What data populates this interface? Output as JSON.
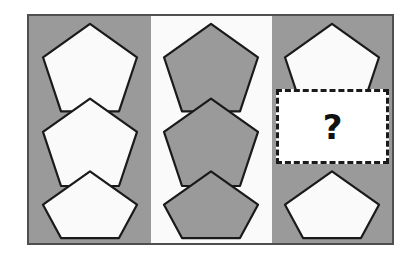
{
  "figure": {
    "frame": {
      "border_color": "#4f4f4f",
      "background_color": "#ffffff"
    },
    "colors": {
      "gray": "#9a9a9a",
      "white": "#fafafa",
      "outline": "#1a1a1a",
      "frame_border": "#4f4f4f",
      "answer_border": "#1a1a1a",
      "answer_fill": "#ffffff",
      "answer_mark_color": "#111111"
    },
    "columns": [
      {
        "name": "left",
        "background": "gray",
        "pentagon_fill": "white",
        "cells": [
          {
            "row": 1,
            "type": "pentagon",
            "fill": "white"
          },
          {
            "row": 2,
            "type": "pentagon",
            "fill": "white"
          },
          {
            "row": 3,
            "type": "pentagon",
            "fill": "white"
          }
        ]
      },
      {
        "name": "middle",
        "background": "white",
        "pentagon_fill": "gray",
        "cells": [
          {
            "row": 1,
            "type": "pentagon",
            "fill": "gray"
          },
          {
            "row": 2,
            "type": "pentagon",
            "fill": "gray"
          },
          {
            "row": 3,
            "type": "pentagon",
            "fill": "gray"
          }
        ]
      },
      {
        "name": "right",
        "background": "gray",
        "pentagon_fill": "white",
        "cells": [
          {
            "row": 1,
            "type": "pentagon",
            "fill": "white"
          },
          {
            "row": 2,
            "type": "answer",
            "fill": "white"
          },
          {
            "row": 3,
            "type": "pentagon",
            "fill": "white"
          }
        ]
      }
    ],
    "answer": {
      "mark": "?",
      "border_style": "dashed"
    }
  }
}
